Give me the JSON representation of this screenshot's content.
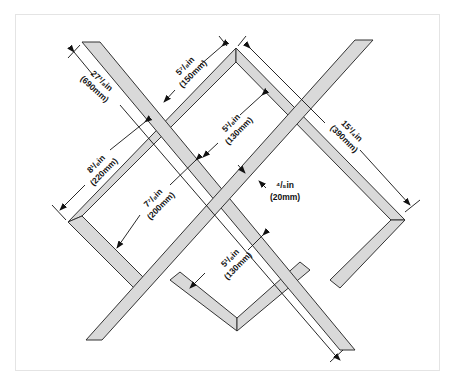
{
  "diagram": {
    "type": "wine-rack-lattice-construction",
    "colors": {
      "wood_fill": "#d9d9d9",
      "wood_edge": "#333333",
      "dimension_line": "#111111",
      "border": "#e4e4e4"
    },
    "dimensions": [
      {
        "id": "overall_length",
        "imperial": "27¹/₈in",
        "metric": "(690mm)"
      },
      {
        "id": "top_gap",
        "imperial": "5⁷/₈in",
        "metric": "(150mm)"
      },
      {
        "id": "right_side",
        "imperial": "15¹/₄in",
        "metric": "(390mm)"
      },
      {
        "id": "left_side",
        "imperial": "8¹/₈in",
        "metric": "(220mm)"
      },
      {
        "id": "inner_upper",
        "imperial": "5¹/₈in",
        "metric": "(130mm)"
      },
      {
        "id": "strip_width",
        "imperial": "⁴/₅in",
        "metric": "(20mm)"
      },
      {
        "id": "inner_left",
        "imperial": "7⁷/₈in",
        "metric": "(200mm)"
      },
      {
        "id": "inner_lower",
        "imperial": "5¹/₈in",
        "metric": "(130mm)"
      }
    ]
  }
}
